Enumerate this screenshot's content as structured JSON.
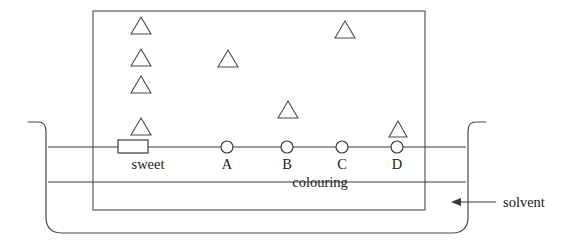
{
  "diagram": {
    "colors": {
      "ink": "#3a3a3a",
      "outline": "#4a4a4a",
      "text": "#1c1c1c",
      "background": "#ffffff"
    },
    "paper": {
      "name": "chromatography-paper",
      "x": 93,
      "y": 11,
      "width": 332,
      "height": 199
    },
    "beaker": {
      "name": "beaker",
      "left_wall_x": 46,
      "right_wall_x": 468,
      "rim_y": 122,
      "bottom_y": 233,
      "corner_radius": 16,
      "lip_length": 18
    },
    "baseline": {
      "label": "start-line",
      "y": 147,
      "x_start": 48,
      "x_end": 466
    },
    "solvent_level": {
      "label": "solvent-level-line",
      "y": 182,
      "x_start": 48,
      "x_end": 466
    },
    "origin_spots": [
      {
        "id": "sweet",
        "label": "sweet",
        "shape": "rectangle",
        "x": 133,
        "y": 147,
        "width": 30,
        "height": 13
      },
      {
        "id": "A",
        "label": "A",
        "shape": "circle",
        "x": 227,
        "y": 147,
        "radius": 6
      },
      {
        "id": "B",
        "label": "B",
        "shape": "circle",
        "x": 287,
        "y": 147,
        "radius": 6
      },
      {
        "id": "C",
        "label": "C",
        "shape": "circle",
        "x": 342,
        "y": 147,
        "radius": 6
      },
      {
        "id": "D",
        "label": "D",
        "shape": "circle",
        "x": 397,
        "y": 147,
        "radius": 6
      }
    ],
    "separated_spots": [
      {
        "id": "sweet-spot-1",
        "lane": "sweet",
        "x": 141,
        "y": 26,
        "size": 19
      },
      {
        "id": "sweet-spot-2",
        "lane": "sweet",
        "x": 141,
        "y": 58,
        "size": 19
      },
      {
        "id": "sweet-spot-3",
        "lane": "sweet",
        "x": 141,
        "y": 85,
        "size": 19
      },
      {
        "id": "sweet-spot-4",
        "lane": "sweet",
        "x": 141,
        "y": 127,
        "size": 19
      },
      {
        "id": "A-spot-1",
        "lane": "A",
        "x": 228,
        "y": 59,
        "size": 19
      },
      {
        "id": "B-spot-1",
        "lane": "B",
        "x": 288,
        "y": 110,
        "size": 19
      },
      {
        "id": "C-spot-1",
        "lane": "C",
        "x": 345,
        "y": 30,
        "size": 19
      },
      {
        "id": "D-spot-1",
        "lane": "D",
        "x": 398,
        "y": 129,
        "size": 17
      }
    ],
    "labels": {
      "sweet": "sweet",
      "A": "A",
      "B": "B",
      "C": "C",
      "D": "D",
      "colouring": "colouring",
      "solvent": "solvent"
    },
    "label_positions": {
      "sweet": {
        "x": 148,
        "y": 169
      },
      "A": {
        "x": 227,
        "y": 169
      },
      "B": {
        "x": 287,
        "y": 169
      },
      "C": {
        "x": 342,
        "y": 169
      },
      "D": {
        "x": 397,
        "y": 169
      },
      "colouring": {
        "x": 320,
        "y": 187
      },
      "solvent": {
        "x": 515,
        "y": 206
      }
    },
    "solvent_callout": {
      "name": "solvent-callout-arrow",
      "line_x_start": 496,
      "line_x_end": 454,
      "y": 202,
      "arrow_tip_x": 452
    }
  }
}
